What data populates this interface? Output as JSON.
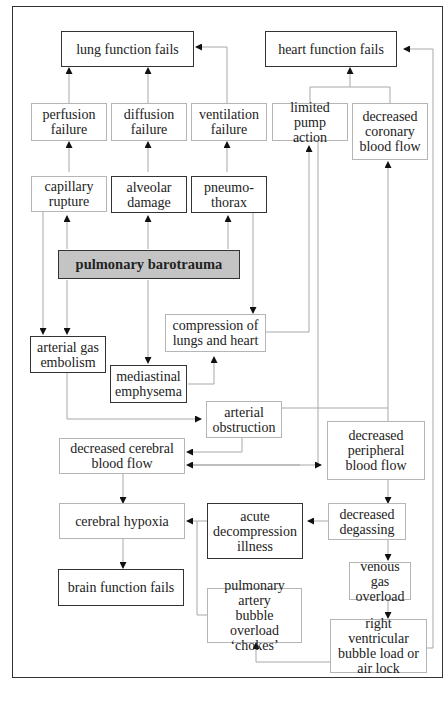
{
  "diagram": {
    "nodes": {
      "lung_fails": "lung function fails",
      "heart_fails": "heart function fails",
      "perfusion_failure": "perfusion\nfailure",
      "diffusion_failure": "diffusion\nfailure",
      "ventilation_failure": "ventilation\nfailure",
      "limited_pump": "limited\npump action",
      "decreased_coronary": "decreased\ncoronary\nblood flow",
      "capillary_rupture": "capillary\nrupture",
      "alveolar_damage": "alveolar\ndamage",
      "pneumothorax": "pneumo-\nthorax",
      "pulmonary_barotrauma": "pulmonary barotrauma",
      "compression": "compression of\nlungs and heart",
      "arterial_gas_embolism": "arterial gas\nembolism",
      "mediastinal_emphysema": "mediastinal\nemphysema",
      "arterial_obstruction": "arterial\nobstruction",
      "decreased_cerebral": "decreased cerebral\nblood flow",
      "decreased_peripheral": "decreased\nperipheral\nblood flow",
      "cerebral_hypoxia": "cerebral hypoxia",
      "acute_dci": "acute\ndecompression\nillness",
      "decreased_degassing": "decreased\ndegassing",
      "brain_fails": "brain function fails",
      "venous_gas_overload": "venous gas\noverload",
      "chokes": "pulmonary artery\nbubble overload\n‘chokes’",
      "right_ventricular": "right ventricular\nbubble load or\nair lock"
    },
    "colors": {
      "root_fill": "#c4c4c4",
      "dark_border": "#333333",
      "light_border": "#b5b5b5",
      "connector": "#a8a8a8"
    }
  }
}
